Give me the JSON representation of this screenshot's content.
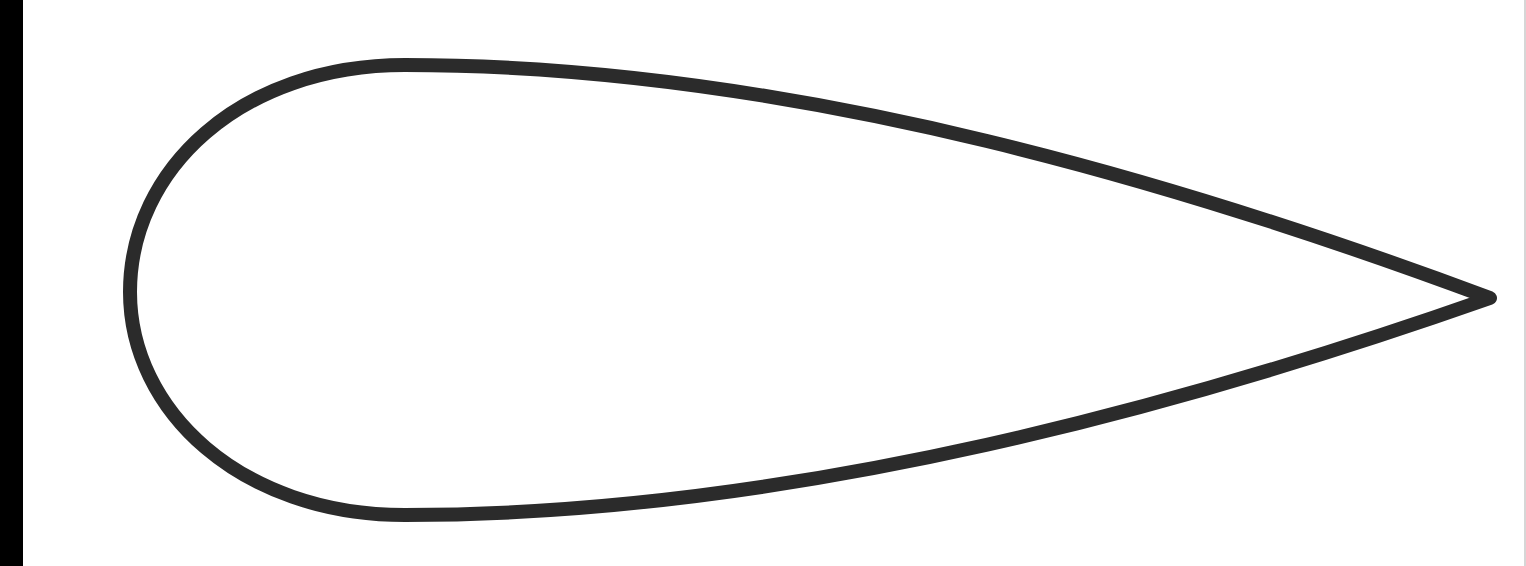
{
  "diagram": {
    "colors": {
      "background": "#ffffff",
      "stroke": "#2b2b2b",
      "left_bar": "#000000",
      "right_edge": "#8a8a8a"
    },
    "stroke_width": 14,
    "shape": {
      "type": "airfoil-outline",
      "leading_edge": {
        "x": 130,
        "y": 292
      },
      "top_extreme": {
        "x": 405,
        "y": 65
      },
      "bottom_extreme": {
        "x": 405,
        "y": 515
      },
      "trailing_edge_tip": {
        "x": 1490,
        "y": 298
      }
    }
  }
}
